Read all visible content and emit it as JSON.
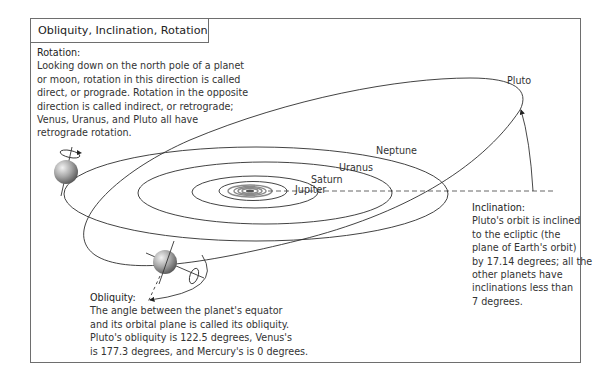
{
  "title": "Obliquity, Inclination, Rotation",
  "rotation": {
    "heading": "Rotation:",
    "lines": [
      "Looking down on the north pole of a planet",
      "or moon, rotation in this direction is called",
      "direct, or prograde. Rotation in the opposite",
      "direction is called indirect, or retrograde;",
      "Venus, Uranus, and Pluto all have",
      "retrograde rotation."
    ]
  },
  "inclination": {
    "heading": "Inclination:",
    "lines": [
      "Pluto's orbit is inclined",
      "to the ecliptic (the",
      "plane of Earth's orbit)",
      "by 17.14 degrees; all the",
      "other planets have",
      "inclinations less than",
      "7 degrees."
    ]
  },
  "obliquity": {
    "heading": "Obliquity:",
    "lines": [
      "The angle between the planet's equator",
      "and its orbital plane is called its obliquity.",
      "Pluto's obliquity is 122.5 degrees, Venus's",
      "is 177.3 degrees, and Mercury's is 0 degrees."
    ]
  },
  "orbit_labels": {
    "pluto": "Pluto",
    "neptune": "Neptune",
    "uranus": "Uranus",
    "saturn": "Saturn",
    "jupiter": "Jupiter"
  },
  "values": {
    "pluto_inclination_deg": 17.14,
    "pluto_obliquity_deg": 122.5,
    "venus_obliquity_deg": 177.3,
    "mercury_obliquity_deg": 0,
    "other_planets_max_inclination_deg": 7
  },
  "colors": {
    "line": "#2e2e2e",
    "frame": "#6e6e6e",
    "planet_light": "#d8d8d8",
    "planet_dark": "#6a6a6a"
  }
}
